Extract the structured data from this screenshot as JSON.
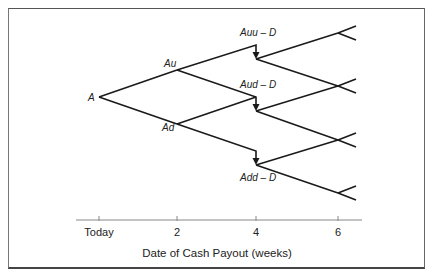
{
  "diagram": {
    "type": "binomial-tree",
    "nodes": {
      "root": "A",
      "up": "Au",
      "down": "Ad",
      "uu_after_dividend": "Auu – D",
      "ud_after_dividend": "Aud – D",
      "dd_after_dividend": "Add – D"
    },
    "axis": {
      "ticks": [
        "Today",
        "2",
        "4",
        "6"
      ],
      "title": "Date of Cash Payout (weeks)"
    },
    "colors": {
      "line": "#1a1a1a",
      "border": "#555555",
      "axis": "#888888"
    }
  }
}
